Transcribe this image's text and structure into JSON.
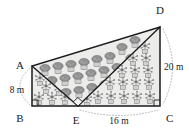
{
  "figure": {
    "type": "geometry-diagram",
    "background_color": "#ffffff",
    "outline_color": "#1a1a1a",
    "fill_color": "#ececeb",
    "dotted_guide_color": "#a8a8a8",
    "vertices": [
      {
        "id": "A",
        "label": "A",
        "x": 32,
        "y": 66,
        "label_x": 20,
        "label_y": 66
      },
      {
        "id": "B",
        "label": "B",
        "x": 32,
        "y": 106,
        "label_x": 20,
        "label_y": 122
      },
      {
        "id": "E",
        "label": "E",
        "x": 78,
        "y": 106,
        "label_x": 74,
        "label_y": 122
      },
      {
        "id": "C",
        "label": "C",
        "x": 160,
        "y": 106,
        "label_x": 167,
        "label_y": 121
      },
      {
        "id": "D",
        "label": "D",
        "x": 160,
        "y": 27,
        "label_x": 160,
        "label_y": 12
      }
    ],
    "edges": [
      {
        "name": "edge-AB",
        "from": "A",
        "to": "B"
      },
      {
        "name": "edge-BC",
        "from": "B",
        "to": "C"
      },
      {
        "name": "edge-CD",
        "from": "C",
        "to": "D"
      },
      {
        "name": "edge-DA",
        "from": "D",
        "to": "A"
      },
      {
        "name": "edge-AE",
        "from": "A",
        "to": "E"
      },
      {
        "name": "edge-ED",
        "from": "E",
        "to": "D"
      }
    ],
    "measurements": [
      {
        "name": "measure-AB",
        "value": "8 m",
        "x": 16,
        "y": 91,
        "anchor": "middle",
        "segment": "AB"
      },
      {
        "name": "measure-EC",
        "value": "16 m",
        "x": 119,
        "y": 123,
        "anchor": "middle",
        "segment": "EC"
      },
      {
        "name": "measure-DC",
        "value": "20 m",
        "x": 164,
        "y": 68,
        "anchor": "start",
        "segment": "DC"
      }
    ],
    "right_angle_markers": [
      {
        "name": "right-angle-B",
        "at": "B"
      },
      {
        "name": "right-angle-C",
        "at": "C"
      },
      {
        "name": "right-angle-E",
        "at": "E"
      }
    ],
    "plant_regions": [
      {
        "name": "bushy-tree-region",
        "style": "round-bushy-tree",
        "region": "triangle A-E-D (upper-left)"
      },
      {
        "name": "palm-plant-region",
        "style": "star-palm-plant",
        "region": "triangle E-D-C (right)"
      },
      {
        "name": "palm-plant-strip",
        "style": "star-palm-plant",
        "region": "triangle A-B-E (lower-left)"
      }
    ]
  }
}
